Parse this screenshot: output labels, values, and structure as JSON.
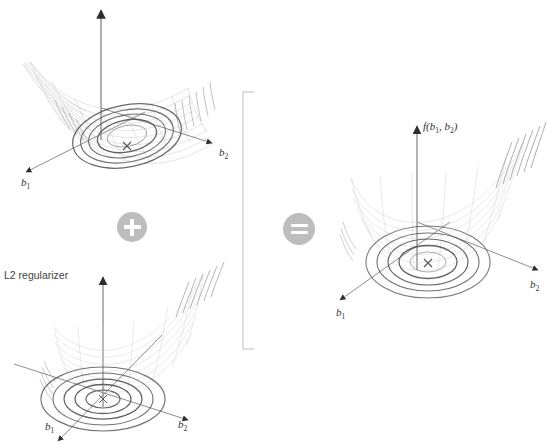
{
  "figure": {
    "type": "diagram",
    "title": "",
    "background_color": "#ffffff",
    "surface_color": "#b9b9b9",
    "contour_color": "#4a4a4a",
    "axis_color": "#8c8c8c",
    "operator_color": "#bdbdbd",
    "operator_glyph_color": "#ffffff"
  },
  "panels": [
    {
      "id": "loss-surface",
      "role": "data-loss",
      "label": "",
      "axes": {
        "x": "b",
        "x_sub": "1",
        "y": "b",
        "y_sub": "2",
        "z": "",
        "z_sub": ""
      },
      "x_label": "b₁",
      "y_label": "b₂",
      "z_label": "",
      "contours": 5,
      "contour_shape": "elongated-ellipse",
      "minimum_marker": "×",
      "valley": "narrow ill-conditioned trough"
    },
    {
      "id": "l2-regularizer",
      "role": "regularizer",
      "label": "L2 regularizer",
      "axes": {
        "x": "b",
        "x_sub": "1",
        "y": "b",
        "y_sub": "2",
        "z": "",
        "z_sub": ""
      },
      "x_label": "b₁",
      "y_label": "b₂",
      "z_label": "",
      "contours": 5,
      "contour_shape": "circle",
      "minimum_marker": "×",
      "valley": "isotropic bowl centered at origin"
    },
    {
      "id": "regularized-objective",
      "role": "sum",
      "label": "",
      "axes": {
        "x": "b",
        "x_sub": "1",
        "y": "b",
        "y_sub": "2",
        "z": "f",
        "z_sub": ""
      },
      "x_label": "b₁",
      "y_label": "b₂",
      "z_label": "f(b₁, b₂)",
      "z_label_parts": {
        "fn": "f(",
        "arg1": "b",
        "arg1_sub": "1",
        "comma": ", ",
        "arg2": "b",
        "arg2_sub": "2",
        "close": ")"
      },
      "contours": 5,
      "contour_shape": "ellipse",
      "minimum_marker": "×",
      "valley": "well-conditioned bowl"
    }
  ],
  "operators": [
    {
      "id": "plus",
      "symbol": "+",
      "name": "plus-operator"
    },
    {
      "id": "equals",
      "symbol": "=",
      "name": "equals-operator"
    }
  ],
  "bracket": {
    "id": "group-bracket",
    "orientation": "vertical-right"
  },
  "caption": {
    "text": ""
  }
}
